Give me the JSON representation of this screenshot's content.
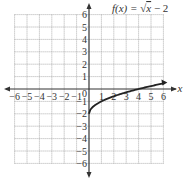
{
  "chart_data": {
    "type": "line",
    "title": "f(x) = √x − 2",
    "title_parts": {
      "fx": "f(x) = ",
      "sqrt": "√",
      "x": "x",
      "rest": " − 2"
    },
    "xlabel": "x",
    "ylabel": "",
    "xlim": [
      -6,
      6
    ],
    "ylim": [
      -6,
      6
    ],
    "grid": true,
    "x_ticks": [
      -6,
      -5,
      -4,
      -3,
      -2,
      -1,
      1,
      2,
      3,
      4,
      5,
      6
    ],
    "y_ticks": [
      -6,
      -5,
      -4,
      -3,
      -2,
      -1,
      1,
      2,
      3,
      4,
      5,
      6
    ],
    "origin_label": "0",
    "series": [
      {
        "name": "f(x) = √x − 2",
        "x": [
          0,
          0.25,
          0.5,
          1,
          2,
          3,
          4,
          5,
          6
        ],
        "values": [
          -2,
          -1.5,
          -1.29,
          -1,
          -0.59,
          -0.27,
          0,
          0.24,
          0.45
        ]
      }
    ],
    "colors": {
      "curve": "#222222",
      "axis": "#333333",
      "grid": "#9a9a9a"
    }
  }
}
